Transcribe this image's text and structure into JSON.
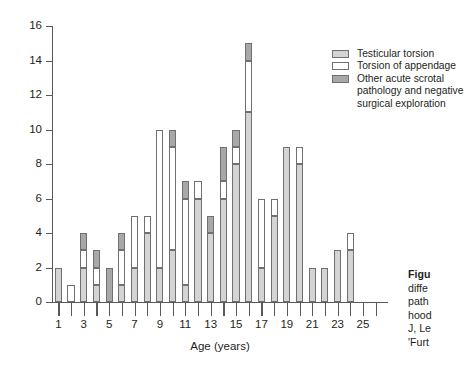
{
  "chart_data": {
    "type": "bar",
    "stacked": true,
    "title": "",
    "xlabel": "Age (years)",
    "ylabel": "",
    "ylim": [
      0,
      16
    ],
    "ytick_step": 2,
    "yticks": [
      0,
      2,
      4,
      6,
      8,
      10,
      12,
      14,
      16
    ],
    "grid": false,
    "legend_position": "top-right",
    "categories": [
      1,
      2,
      3,
      4,
      5,
      6,
      7,
      8,
      9,
      10,
      11,
      12,
      13,
      14,
      15,
      16,
      17,
      18,
      19,
      20,
      21,
      22,
      23,
      24,
      25,
      26
    ],
    "xtick_labels": [
      "1",
      "",
      "3",
      "",
      "5",
      "",
      "7",
      "",
      "9",
      "",
      "11",
      "",
      "13",
      "",
      "15",
      "",
      "17",
      "",
      "19",
      "",
      "21",
      "",
      "23",
      "",
      "25",
      ""
    ],
    "series": [
      {
        "name": "Testicular torsion",
        "color": "#d4d4d2",
        "values": [
          2,
          0,
          2,
          1,
          0,
          1,
          2,
          4,
          2,
          3,
          1,
          6,
          4,
          6,
          8,
          11,
          2,
          5,
          9,
          8,
          2,
          2,
          3,
          3,
          0,
          0
        ]
      },
      {
        "name": "Torsion of appendage",
        "color": "#ffffff",
        "values": [
          0,
          1,
          1,
          1,
          0,
          2,
          3,
          1,
          8,
          6,
          5,
          1,
          0,
          1,
          1,
          3,
          4,
          1,
          0,
          1,
          0,
          0,
          0,
          1,
          0,
          0
        ]
      },
      {
        "name": "Other acute scrotal pathology and negative surgical exploration",
        "color": "#a6a8a9",
        "values": [
          0,
          0,
          1,
          1,
          2,
          1,
          0,
          0,
          0,
          1,
          1,
          0,
          1,
          2,
          1,
          1,
          0,
          0,
          0,
          0,
          0,
          0,
          0,
          0,
          0,
          0
        ]
      }
    ],
    "totals": [
      2,
      1,
      4,
      3,
      2,
      4,
      5,
      5,
      10,
      10,
      7,
      7,
      5,
      9,
      10,
      15,
      6,
      6,
      9,
      9,
      2,
      2,
      3,
      4,
      0,
      0
    ]
  },
  "legend": {
    "items": [
      {
        "label": "Testicular torsion",
        "swatch": "s0"
      },
      {
        "label": "Torsion of appendage",
        "swatch": "s1"
      },
      {
        "label": "Other acute scrotal",
        "swatch": "s2"
      }
    ],
    "continuation": [
      "pathology and negative",
      "surgical exploration"
    ]
  },
  "caption": {
    "lines": [
      "Figu",
      "diffe",
      "path",
      "hood",
      "J, Le",
      "'Furt"
    ]
  }
}
